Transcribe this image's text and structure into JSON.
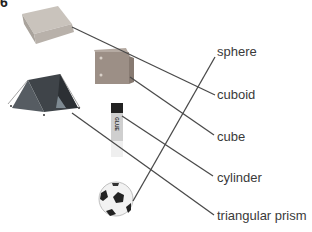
{
  "question": {
    "number": "6"
  },
  "objects": [
    {
      "id": "box",
      "name": "cardboard box"
    },
    {
      "id": "dice",
      "name": "dice block"
    },
    {
      "id": "tent",
      "name": "tent"
    },
    {
      "id": "glue",
      "name": "glue stick",
      "text": "GLUE"
    },
    {
      "id": "ball",
      "name": "football"
    }
  ],
  "labels": [
    {
      "id": "sphere",
      "text": "sphere"
    },
    {
      "id": "cuboid",
      "text": "cuboid"
    },
    {
      "id": "cube",
      "text": "cube"
    },
    {
      "id": "cylinder",
      "text": "cylinder"
    },
    {
      "id": "triangular_prism",
      "text": "triangular prism"
    }
  ],
  "matches": [
    {
      "from": "box",
      "to": "cuboid"
    },
    {
      "from": "dice",
      "to": "cube"
    },
    {
      "from": "tent",
      "to": "triangular_prism"
    },
    {
      "from": "glue",
      "to": "cylinder"
    },
    {
      "from": "ball",
      "to": "sphere"
    }
  ],
  "colors": {
    "line": "#4a4a4a",
    "text": "#3a3a3a"
  }
}
